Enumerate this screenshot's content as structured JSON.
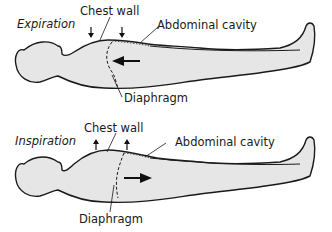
{
  "panels": [
    {
      "title": "Expiration",
      "labels": {
        "chest_wall": "Chest wall",
        "abdominal_cavity": "Abdominal cavity",
        "diaphragm": "Diaphragm"
      },
      "arrow_direction": "left",
      "chest_arrows": "down"
    },
    {
      "title": "Inspiration",
      "labels": {
        "chest_wall": "Chest wall",
        "abdominal_cavity": "Abdominal cavity",
        "diaphragm": "Diaphragm"
      },
      "arrow_direction": "right",
      "chest_arrows": "up"
    }
  ],
  "colors": {
    "body_fill": "#e6e6e6",
    "outline": "#1a1a1a"
  }
}
